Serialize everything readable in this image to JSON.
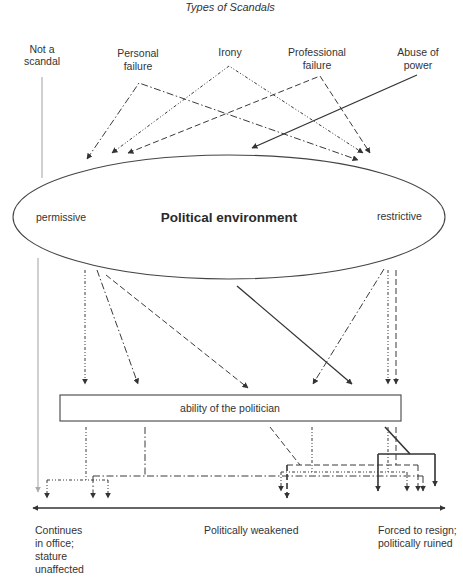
{
  "title": "Types of Scandals",
  "scandal_types": [
    {
      "id": "not-a-scandal",
      "lines": [
        "Not a",
        "scandal"
      ],
      "line_style": "solid-gray"
    },
    {
      "id": "personal-failure",
      "lines": [
        "Personal",
        "failure"
      ],
      "line_style": "dash-dot"
    },
    {
      "id": "irony",
      "lines": [
        "Irony"
      ],
      "line_style": "dash-dot-dot"
    },
    {
      "id": "professional-failure",
      "lines": [
        "Professional",
        "failure"
      ],
      "line_style": "long-dash"
    },
    {
      "id": "abuse-of-power",
      "lines": [
        "Abuse of",
        "power"
      ],
      "line_style": "solid"
    }
  ],
  "environment": {
    "label": "Political environment",
    "left": "permissive",
    "right": "restrictive"
  },
  "ability_box": {
    "label": "ability of the politician"
  },
  "outcomes": {
    "left": [
      "Continues",
      "in office;",
      "stature",
      "unaffected"
    ],
    "middle": "Politically weakened",
    "right": [
      "Forced to resign;",
      "politically ruined"
    ]
  },
  "colors": {
    "lines": "#333333",
    "not_a_scandal_line": "#aaaaaa",
    "background": "#ffffff"
  }
}
